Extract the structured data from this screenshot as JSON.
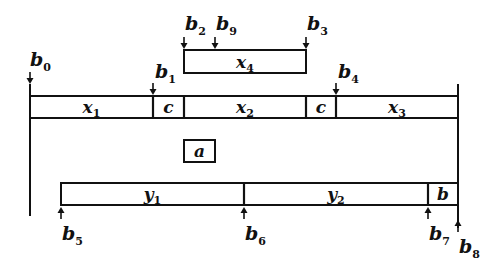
{
  "diagram": {
    "top_box": {
      "label": "x",
      "sub": "4",
      "x0": 184,
      "x1": 306,
      "y0": 50,
      "y1": 73
    },
    "main_bar": {
      "x0": 30,
      "x1": 458,
      "y0": 96,
      "y1": 118,
      "segments": [
        {
          "label": "x",
          "sub": "1",
          "x0": 30,
          "x1": 153
        },
        {
          "label": "c",
          "sub": "",
          "x0": 153,
          "x1": 184
        },
        {
          "label": "x",
          "sub": "2",
          "x0": 184,
          "x1": 306
        },
        {
          "label": "c",
          "sub": "",
          "x0": 306,
          "x1": 336
        },
        {
          "label": "x",
          "sub": "3",
          "x0": 336,
          "x1": 458
        }
      ]
    },
    "middle_box": {
      "label": "a",
      "sub": "",
      "x0": 184,
      "x1": 215,
      "y0": 140,
      "y1": 162
    },
    "bottom_bar": {
      "x0": 61,
      "x1": 458,
      "y0": 183,
      "y1": 205,
      "segments": [
        {
          "label": "y",
          "sub": "1",
          "x0": 61,
          "x1": 244
        },
        {
          "label": "y",
          "sub": "2",
          "x0": 244,
          "x1": 428
        },
        {
          "label": "b",
          "sub": "",
          "x0": 428,
          "x1": 458
        }
      ]
    },
    "vertical_lines": [
      {
        "name": "left-boundary",
        "x": 30,
        "y0": 84,
        "y1": 216
      },
      {
        "name": "right-boundary",
        "x": 458,
        "y0": 84,
        "y1": 228
      }
    ],
    "markers": [
      {
        "label": "b",
        "sub": "0",
        "x": 30,
        "direction": "down",
        "tip_y": 84,
        "text_x": 30,
        "text_y": 66
      },
      {
        "label": "b",
        "sub": "1",
        "x": 153,
        "direction": "down",
        "tip_y": 95,
        "text_x": 155,
        "text_y": 78
      },
      {
        "label": "b",
        "sub": "2",
        "x": 184,
        "direction": "down",
        "tip_y": 49,
        "text_x": 185,
        "text_y": 30
      },
      {
        "label": "b",
        "sub": "9",
        "x": 215,
        "direction": "down",
        "tip_y": 49,
        "text_x": 216,
        "text_y": 30
      },
      {
        "label": "b",
        "sub": "3",
        "x": 306,
        "direction": "down",
        "tip_y": 49,
        "text_x": 307,
        "text_y": 30
      },
      {
        "label": "b",
        "sub": "4",
        "x": 336,
        "direction": "down",
        "tip_y": 95,
        "text_x": 338,
        "text_y": 78
      },
      {
        "label": "b",
        "sub": "5",
        "x": 61,
        "direction": "up",
        "tip_y": 207,
        "text_x": 62,
        "text_y": 240
      },
      {
        "label": "b",
        "sub": "6",
        "x": 244,
        "direction": "up",
        "tip_y": 207,
        "text_x": 245,
        "text_y": 240
      },
      {
        "label": "b",
        "sub": "7",
        "x": 428,
        "direction": "up",
        "tip_y": 207,
        "text_x": 429,
        "text_y": 240
      },
      {
        "label": "b",
        "sub": "8",
        "x": 458,
        "direction": "up",
        "tip_y": 220,
        "text_x": 459,
        "text_y": 253
      }
    ]
  }
}
